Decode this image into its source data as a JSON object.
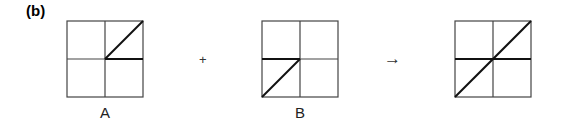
{
  "panel_label": "(b)",
  "operators": {
    "plus": "+",
    "arrow": "→"
  },
  "grids": [
    {
      "label": "A",
      "x": 67,
      "y": 21,
      "size": 76,
      "segments": [
        {
          "from": [
            0.5,
            0.5
          ],
          "to": [
            1,
            0
          ],
          "desc": "diagonal center to top-right"
        },
        {
          "from": [
            0.5,
            0.5
          ],
          "to": [
            1,
            0.5
          ],
          "desc": "horizontal center to right"
        }
      ]
    },
    {
      "label": "B",
      "x": 262,
      "y": 21,
      "size": 76,
      "segments": [
        {
          "from": [
            0,
            0.5
          ],
          "to": [
            0.5,
            0.5
          ],
          "desc": "horizontal left to center"
        },
        {
          "from": [
            0.5,
            0.5
          ],
          "to": [
            0,
            1
          ],
          "desc": "diagonal center to bottom-left"
        }
      ]
    },
    {
      "label": "",
      "x": 455,
      "y": 21,
      "size": 76,
      "segments": [
        {
          "from": [
            0,
            0.5
          ],
          "to": [
            1,
            0.5
          ],
          "desc": "full horizontal"
        },
        {
          "from": [
            0,
            1
          ],
          "to": [
            1,
            0
          ],
          "desc": "full diagonal"
        }
      ]
    }
  ],
  "colors": {
    "grid": "#444444",
    "stroke": "#111111"
  }
}
